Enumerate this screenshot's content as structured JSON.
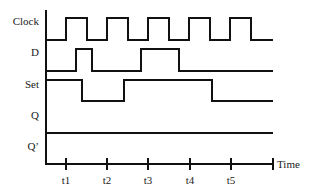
{
  "diagram": {
    "type": "timing-diagram",
    "colors": {
      "line": "#111111",
      "text": "#1a1a1a",
      "background": "#ffffff"
    },
    "axis": {
      "x0": 46,
      "x_end": 273,
      "top": 10,
      "time_axis_y": 164,
      "label": "Time",
      "ticks": [
        {
          "label": "t1",
          "x": 66
        },
        {
          "label": "t2",
          "x": 107
        },
        {
          "label": "t3",
          "x": 148
        },
        {
          "label": "t4",
          "x": 190
        },
        {
          "label": "t5",
          "x": 231
        }
      ]
    },
    "signals": [
      {
        "name": "Clock",
        "label_y": 25,
        "low_y": 40,
        "high_y": 18,
        "high_intervals": [
          [
            66,
            87
          ],
          [
            107,
            128
          ],
          [
            148,
            169
          ],
          [
            189,
            210
          ],
          [
            230,
            251
          ]
        ]
      },
      {
        "name": "D",
        "label_y": 56,
        "low_y": 71,
        "high_y": 49,
        "high_intervals": [
          [
            76,
            92
          ],
          [
            141,
            179
          ]
        ]
      },
      {
        "name": "Set",
        "label_y": 88,
        "low_y": 101,
        "high_y": 80,
        "high_intervals": [
          [
            46,
            82
          ],
          [
            124,
            212
          ]
        ]
      },
      {
        "name": "Q",
        "label_y": 119,
        "low_y": 133,
        "high_y": 112,
        "high_intervals": []
      },
      {
        "name": "Q’",
        "label_y": 150,
        "low_y": 164,
        "high_y": 143,
        "high_intervals": []
      }
    ]
  }
}
